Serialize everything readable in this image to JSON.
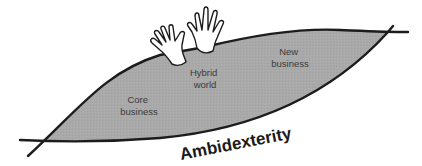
{
  "diagram": {
    "title": "Ambidexterity",
    "regions": [
      {
        "id": "core",
        "line1": "Core",
        "line2": "business"
      },
      {
        "id": "hybrid",
        "line1": "Hybrid",
        "line2": "world"
      },
      {
        "id": "new",
        "line1": "New",
        "line2": "business"
      }
    ],
    "icons": [
      "left-hand-icon",
      "right-hand-icon"
    ],
    "colors": {
      "fill": "#a9a9a9",
      "stroke": "#1c1c1c",
      "background": "#ffffff",
      "hand_fill": "#ffffff"
    }
  }
}
